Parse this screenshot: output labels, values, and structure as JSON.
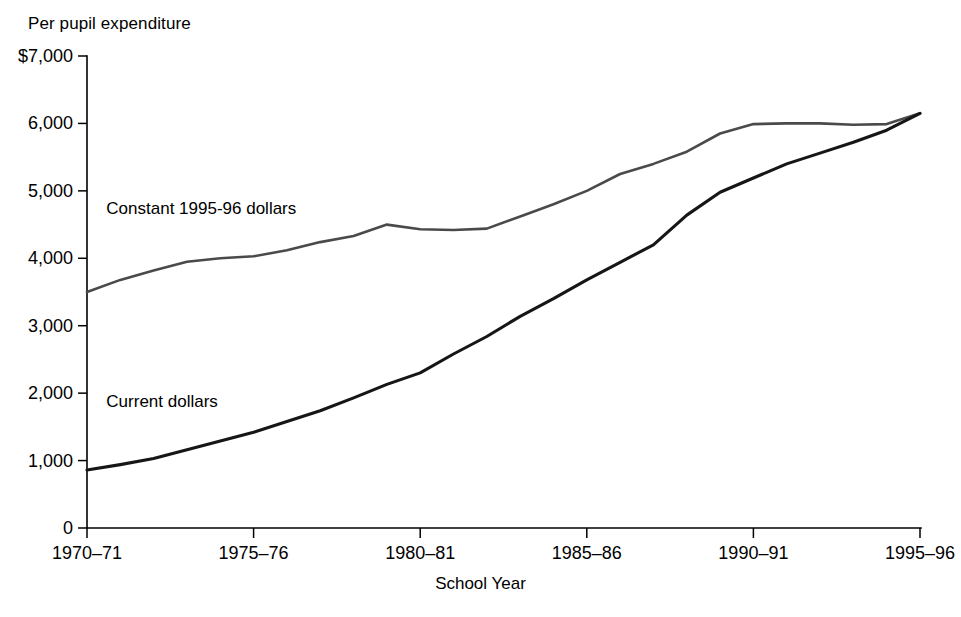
{
  "chart_data": {
    "type": "line",
    "title": "Per pupil expenditure",
    "xlabel": "School Year",
    "ylabel": "",
    "grid": false,
    "legend_position": "inline-annotation",
    "ylim": [
      0,
      7000
    ],
    "ytick_labels": [
      "$7,000",
      "6,000",
      "5,000",
      "4,000",
      "3,000",
      "2,000",
      "1,000",
      "0"
    ],
    "ytick_values": [
      7000,
      6000,
      5000,
      4000,
      3000,
      2000,
      1000,
      0
    ],
    "xtick_labels": [
      "1970–71",
      "1975–76",
      "1980–81",
      "1985–86",
      "1990–91",
      "1995–96"
    ],
    "xtick_values": [
      1970,
      1975,
      1980,
      1985,
      1990,
      1995
    ],
    "xlim": [
      1970,
      1995
    ],
    "x": [
      1970,
      1971,
      1972,
      1973,
      1974,
      1975,
      1976,
      1977,
      1978,
      1979,
      1980,
      1981,
      1982,
      1983,
      1984,
      1985,
      1986,
      1987,
      1988,
      1989,
      1990,
      1991,
      1992,
      1993,
      1994,
      1995
    ],
    "series": [
      {
        "name": "Constant 1995-96 dollars",
        "label": "Constant 1995-96 dollars",
        "color": "#4a4a4a",
        "values": [
          3500,
          3680,
          3820,
          3950,
          4000,
          4030,
          4120,
          4240,
          4330,
          4500,
          4430,
          4420,
          4440,
          4620,
          4800,
          5000,
          5250,
          5400,
          5580,
          5850,
          5990,
          6000,
          6000,
          5980,
          5990,
          6150
        ]
      },
      {
        "name": "Current dollars",
        "label": "Current dollars",
        "color": "#161616",
        "values": [
          860,
          940,
          1030,
          1160,
          1290,
          1420,
          1580,
          1740,
          1930,
          2130,
          2300,
          2580,
          2840,
          3140,
          3400,
          3680,
          3940,
          4200,
          4640,
          4980,
          5190,
          5400,
          5560,
          5720,
          5900,
          6150
        ]
      }
    ],
    "annotations": [
      {
        "text": "Constant 1995-96 dollars",
        "x": 1970.1,
        "y": 4650
      },
      {
        "text": "Current dollars",
        "x": 1970.1,
        "y": 1800
      }
    ]
  }
}
